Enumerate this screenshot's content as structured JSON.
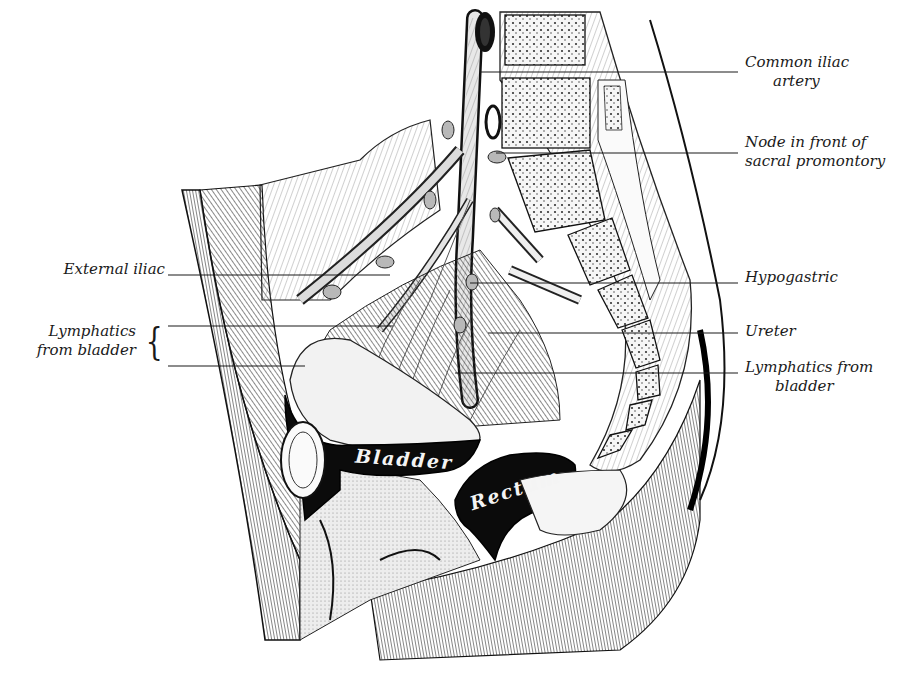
{
  "figure": {
    "colors": {
      "ink": "#1a1a1a",
      "paper": "#ffffff",
      "shade": "#6e6e6e",
      "dark": "#0d0d0d"
    }
  },
  "labels": {
    "common_iliac": {
      "line1": "Common iliac",
      "line2": "artery"
    },
    "node_sacral": {
      "line1": "Node in front of",
      "line2": "sacral promontory"
    },
    "hypogastric": {
      "line1": "Hypogastric"
    },
    "ureter": {
      "line1": "Ureter"
    },
    "lymph_right": {
      "line1": "Lymphatics from",
      "line2": "bladder"
    },
    "external_iliac": {
      "line1": "External iliac"
    },
    "lymph_left": {
      "line1": "Lymphatics",
      "line2": "from bladder",
      "brace": "{"
    }
  },
  "organs": {
    "bladder": "Bladder",
    "rectum": "Rectum"
  }
}
